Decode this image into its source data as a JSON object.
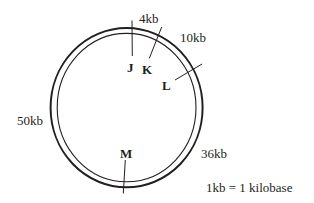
{
  "diagram": {
    "type": "circular genetic map",
    "colors": {
      "line": "#231f20",
      "background": "#ffffff"
    },
    "position_labels": [
      {
        "id": "4kb",
        "text": "4kb"
      },
      {
        "id": "10kb",
        "text": "10kb"
      },
      {
        "id": "36kb",
        "text": "36kb"
      },
      {
        "id": "50kb",
        "text": "50kb"
      }
    ],
    "genes": [
      {
        "id": "J",
        "label": "J"
      },
      {
        "id": "K",
        "label": "K"
      },
      {
        "id": "L",
        "label": "L"
      },
      {
        "id": "M",
        "label": "M"
      }
    ],
    "legend": {
      "text": "1kb = 1 kilobase"
    }
  }
}
